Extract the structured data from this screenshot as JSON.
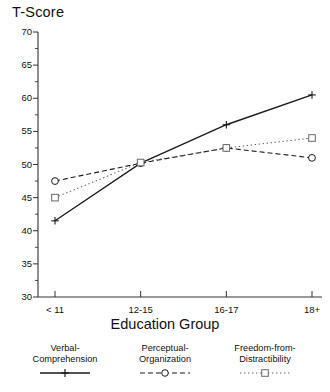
{
  "chart_data": {
    "type": "line",
    "title": "",
    "ylabel": "T-Score",
    "xlabel": "Education Group",
    "categories": [
      "< 11",
      "12-15",
      "16-17",
      "18+"
    ],
    "ylim": [
      30,
      70
    ],
    "yticks": [
      30,
      35,
      40,
      45,
      50,
      55,
      60,
      65,
      70
    ],
    "ytick_labels": [
      "30",
      "35",
      "40",
      "45",
      "50",
      "55",
      "60",
      "65",
      "70"
    ],
    "minor_tick_step": 2.5,
    "grid": false,
    "legend_position": "bottom",
    "series": [
      {
        "name": "Verbal-Comprehension",
        "label_line1": "Verbal-",
        "label_line2": "Comprehension",
        "marker": "plus",
        "linestyle": "solid",
        "color": "#1a1a1a",
        "values": [
          41.5,
          50.2,
          56.0,
          60.5
        ]
      },
      {
        "name": "Perceptual-Organization",
        "label_line1": "Perceptual-",
        "label_line2": "Organization",
        "marker": "circle",
        "linestyle": "dashed",
        "color": "#1a1a1a",
        "values": [
          47.5,
          50.2,
          52.5,
          51.0
        ]
      },
      {
        "name": "Freedom-from-Distractibility",
        "label_line1": "Freedom-from-",
        "label_line2": "Distractibility",
        "marker": "square",
        "linestyle": "dotted",
        "color": "#666666",
        "values": [
          45.0,
          50.3,
          52.5,
          54.0
        ]
      }
    ]
  }
}
